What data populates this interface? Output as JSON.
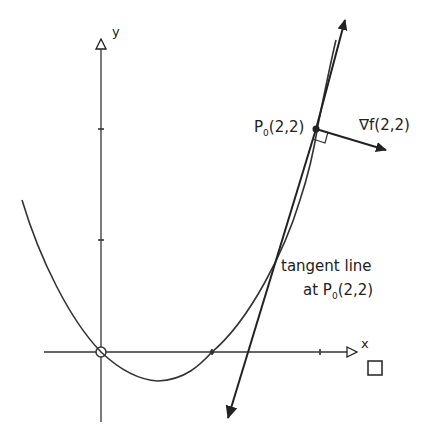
{
  "diagram": {
    "type": "gradient-tangent-sketch",
    "axes": {
      "x_label": "x",
      "y_label": "y",
      "origin_px": [
        101,
        352
      ],
      "x_end_px": [
        358,
        352
      ],
      "y_top_px": [
        101,
        38
      ],
      "y_bottom_px": [
        101,
        420
      ],
      "x_ticks_px": [
        212,
        320
      ],
      "y_ticks_px": [
        240,
        129
      ]
    },
    "point": {
      "name": "P",
      "subscript": "0",
      "coords": "(2,2)",
      "label": "P0(2,2)",
      "px": [
        316,
        129
      ]
    },
    "gradient": {
      "label": "∇f(2,2)",
      "symbol": "∇f",
      "args": "(2,2)"
    },
    "tangent": {
      "line1": "tangent line",
      "line2_prefix": "at P",
      "line2_sub": "0",
      "line2_suffix": "(2,2)"
    },
    "box_symbol": "□",
    "colors": {
      "ink": "#222222",
      "background": "#ffffff"
    }
  }
}
